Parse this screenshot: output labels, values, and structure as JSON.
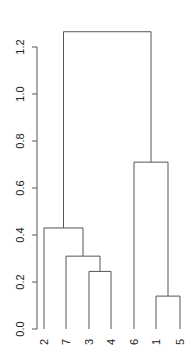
{
  "chart_data": {
    "type": "dendrogram",
    "title": "",
    "xlabel": "",
    "ylabel": "",
    "ylim": [
      0,
      1.3
    ],
    "yticks": [
      0.0,
      0.2,
      0.4,
      0.6,
      0.8,
      1.0,
      1.2
    ],
    "ytick_labels": [
      "0.0",
      "0.2",
      "0.4",
      "0.6",
      "0.8",
      "1.0",
      "1.2"
    ],
    "leaf_order": [
      "2",
      "7",
      "3",
      "4",
      "6",
      "1",
      "5"
    ],
    "merges": [
      {
        "left": "3",
        "right": "4",
        "height": 0.245
      },
      {
        "left": "1",
        "right": "5",
        "height": 0.14
      },
      {
        "left": "7",
        "right": "(3,4)",
        "height": 0.31
      },
      {
        "left": "2",
        "right": "(7,(3,4))",
        "height": 0.43
      },
      {
        "left": "6",
        "right": "(1,5)",
        "height": 0.71
      },
      {
        "left": "(2,(7,(3,4)))",
        "right": "(6,(1,5))",
        "height": 1.265
      }
    ],
    "grid": false,
    "legend": null
  }
}
